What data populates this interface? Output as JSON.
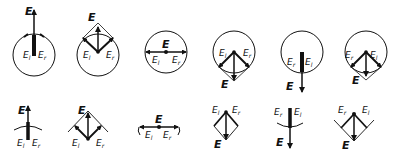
{
  "diagram": {
    "colors": {
      "ink": "#111111",
      "background": "#ffffff"
    },
    "labels": {
      "resultant": "E",
      "left": "E",
      "left_sub": "l",
      "right": "E",
      "right_sub": "r"
    },
    "row_top": {
      "description": "Components shown on reference circles",
      "panels": [
        {
          "index": 1,
          "phase": "E up, E_l and E_r parallel (up)"
        },
        {
          "index": 2,
          "phase": "E up, E_l and E_r at ±45°"
        },
        {
          "index": 3,
          "phase": "E zero, E_l left, E_r right"
        },
        {
          "index": 4,
          "phase": "E down, E_l and E_r at ±45° below"
        },
        {
          "index": 5,
          "phase": "E down, E_l and E_r parallel (down)"
        },
        {
          "index": 6,
          "phase": "E down, E_l and E_r at ±45° below (swapped)"
        }
      ]
    },
    "row_bottom": {
      "description": "Same phases with arc segments only",
      "panels": [
        {
          "index": 1
        },
        {
          "index": 2
        },
        {
          "index": 3
        },
        {
          "index": 4
        },
        {
          "index": 5
        },
        {
          "index": 6
        }
      ]
    }
  }
}
